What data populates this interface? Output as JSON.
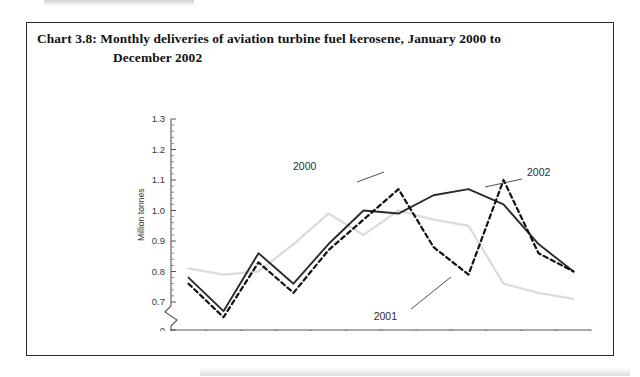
{
  "document": {
    "chart_number": "Chart 3.8:",
    "title_line1": "Monthly deliveries of aviation turbine fuel kerosene, January 2000 to",
    "title_line2": "December 2002"
  },
  "colors": {
    "series_2000": "#2b2b2b",
    "series_2001": "#dcdcdc",
    "series_2002": "#111111",
    "axis": "#555555",
    "frame": "#2b2b2b",
    "page_background": "#ffffff"
  },
  "chart_data": {
    "type": "line",
    "title": "Chart 3.8: Monthly deliveries of aviation turbine fuel kerosene, January 2000 to December 2002",
    "xlabel": "",
    "ylabel": "Million tonnes",
    "categories": [
      "J",
      "F",
      "M",
      "A",
      "M",
      "J",
      "J",
      "A",
      "S",
      "O",
      "N",
      "D"
    ],
    "category_names": [
      "January",
      "February",
      "March",
      "April",
      "May",
      "June",
      "July",
      "August",
      "September",
      "October",
      "November",
      "December"
    ],
    "ylim": [
      0.65,
      1.3
    ],
    "yticks": [
      "0.7",
      "0.8",
      "0.9",
      "1.0",
      "1.1",
      "1.2",
      "1.3"
    ],
    "ytick_values": [
      0.7,
      0.8,
      0.9,
      1.0,
      1.1,
      1.2,
      1.3
    ],
    "zero_tick": "0",
    "axis_break": true,
    "grid": false,
    "legend_position": "inline-annotations",
    "series": [
      {
        "name": "2000",
        "style": "solid",
        "color": "#2b2b2b",
        "values": [
          0.78,
          0.67,
          0.86,
          0.76,
          0.89,
          1.0,
          0.99,
          1.05,
          1.07,
          1.02,
          0.89,
          0.8
        ]
      },
      {
        "name": "2001",
        "style": "solid-light",
        "color": "#dcdcdc",
        "values": [
          0.81,
          0.79,
          0.8,
          0.89,
          0.99,
          0.92,
          1.0,
          0.97,
          0.95,
          0.76,
          0.73,
          0.71
        ]
      },
      {
        "name": "2002",
        "style": "dashed",
        "color": "#111111",
        "values": [
          0.76,
          0.65,
          0.83,
          0.73,
          0.87,
          0.97,
          1.07,
          0.88,
          0.79,
          1.1,
          0.86,
          0.8
        ]
      }
    ],
    "annotations": [
      {
        "label": "2000",
        "series": "2000"
      },
      {
        "label": "2001",
        "series": "2001"
      },
      {
        "label": "2002",
        "series": "2002"
      }
    ]
  }
}
